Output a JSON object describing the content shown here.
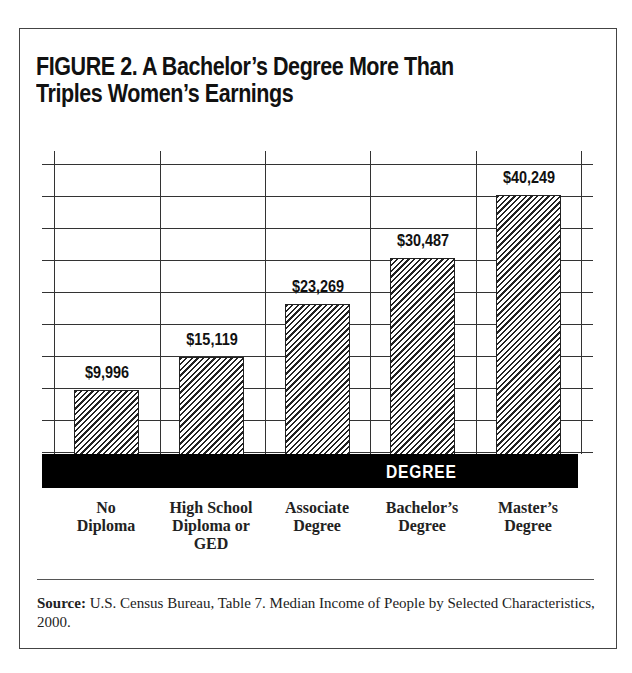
{
  "figure": {
    "title_line1": "FIGURE 2. A Bachelor’s Degree More Than",
    "title_line2": "Triples Women’s Earnings",
    "band_label": "DEGREE",
    "source_label": "Source:",
    "source_text": " U.S. Census Bureau, Table 7. Median Income of People by Selected Characteristics, 2000."
  },
  "chart_data": {
    "type": "bar",
    "title": "FIGURE 2. A Bachelor’s Degree More Than Triples Women’s Earnings",
    "xlabel": "DEGREE",
    "ylabel": "",
    "categories": [
      "No Diploma",
      "High School Diploma or GED",
      "Associate Degree",
      "Bachelor’s Degree",
      "Master’s Degree"
    ],
    "category_lines": [
      [
        "No",
        "Diploma"
      ],
      [
        "High School",
        "Diploma or",
        "GED"
      ],
      [
        "Associate",
        "Degree"
      ],
      [
        "Bachelor’s",
        "Degree"
      ],
      [
        "Master’s",
        "Degree"
      ]
    ],
    "values": [
      9996,
      15119,
      23269,
      30487,
      40249
    ],
    "value_labels": [
      "$9,996",
      "$15,119",
      "$23,269",
      "$30,487",
      "$40,249"
    ],
    "grid": true,
    "legend": "none",
    "bar_fill": "diagonal-hatch",
    "source": "Source: U.S. Census Bureau, Table 7. Median Income of People by Selected Characteristics, 2000."
  }
}
